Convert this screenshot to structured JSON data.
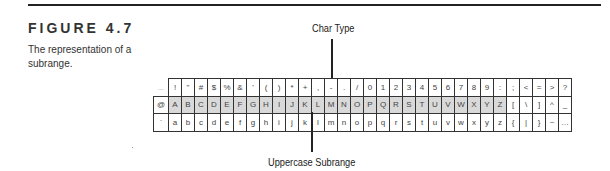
{
  "figure": {
    "title": "FIGURE 4.7",
    "caption": "The representation of a subrange."
  },
  "callouts": {
    "top": "Char Type",
    "bottom": "Uppercase Subrange"
  },
  "colors": {
    "shade": "#d9d9d9",
    "lines": "#222222"
  },
  "grid": {
    "rows": [
      {
        "header": "...",
        "cells": [
          "!",
          "\"",
          "#",
          "$",
          "%",
          "&",
          "'",
          "(",
          ")",
          "*",
          "+",
          ",",
          "-",
          ".",
          "/",
          "0",
          "1",
          "2",
          "3",
          "4",
          "5",
          "6",
          "7",
          "8",
          "9",
          ":",
          ";",
          "<",
          "=",
          ">",
          "?"
        ]
      },
      {
        "header": "@",
        "cells": [
          "A",
          "B",
          "C",
          "D",
          "E",
          "F",
          "G",
          "H",
          "I",
          "J",
          "K",
          "L",
          "M",
          "N",
          "O",
          "P",
          "Q",
          "R",
          "S",
          "T",
          "U",
          "V",
          "W",
          "X",
          "Y",
          "Z",
          "[",
          "\\",
          "]",
          "^",
          "_"
        ]
      },
      {
        "header": "`",
        "cells": [
          "a",
          "b",
          "c",
          "d",
          "e",
          "f",
          "g",
          "h",
          "i",
          "j",
          "k",
          "l",
          "m",
          "n",
          "o",
          "p",
          "q",
          "r",
          "s",
          "t",
          "u",
          "v",
          "w",
          "x",
          "y",
          "z",
          "{",
          "|",
          "}",
          "~",
          "…"
        ]
      }
    ],
    "shaded_range": {
      "row": 1,
      "from": 0,
      "to": 25
    }
  }
}
